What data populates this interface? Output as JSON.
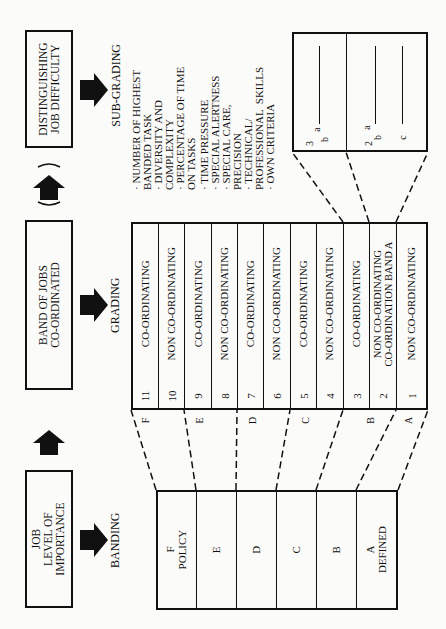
{
  "stages": {
    "job_level": {
      "label": "JOB\nLEVEL OF\nIMPORTANCE"
    },
    "band_of_jobs": {
      "label": "BAND OF JOBS\nCO-ORDINATED"
    },
    "job_difficulty": {
      "label": "DISTINGUISHING\nJOB DIFFICULTY"
    }
  },
  "process_labels": {
    "banding": "BANDING",
    "grading": "GRADING",
    "sub_grading": "SUB-GRADING"
  },
  "banding_table": {
    "bands": [
      {
        "label": "F\nPOLICY"
      },
      {
        "label": "E"
      },
      {
        "label": "D"
      },
      {
        "label": "C"
      },
      {
        "label": "B"
      },
      {
        "label": "A\nDEFINED"
      }
    ]
  },
  "grading_table": {
    "grades": [
      {
        "num": "11",
        "label": "CO-ORDINATING"
      },
      {
        "num": "10",
        "label": "NON CO-ORDINATING"
      },
      {
        "num": "9",
        "label": "CO-ORDINATING"
      },
      {
        "num": "8",
        "label": "NON CO-ORDINATING"
      },
      {
        "num": "7",
        "label": "CO-ORDINATING"
      },
      {
        "num": "6",
        "label": "NON CO-ORDINATING"
      },
      {
        "num": "5",
        "label": "CO-ORDINATING"
      },
      {
        "num": "4",
        "label": "NON CO-ORDINATING"
      },
      {
        "num": "3",
        "label": "CO-ORDINATING"
      },
      {
        "num": "2",
        "label": "NON CO-ORDINATING\nCO-ORDINATION BAND A"
      },
      {
        "num": "1",
        "label": "NON CO-ORDINATING"
      }
    ],
    "band_markers": [
      "F",
      "E",
      "D",
      "C",
      "B",
      "A"
    ]
  },
  "sub_grading": {
    "criteria": [
      "NUMBER OF HIGHEST\nBANDED TASK",
      "DIVERSITY AND\nCOMPLEXITY",
      "PERCENTAGE OF TIME\nON TASKS",
      "TIME PRESSURE",
      "SPECIAL ALERTNESS",
      "SPECIAL CARE,\nPRECISION",
      "TECHNICAL/\nPROFESSIONAL  SKILLS",
      "OWN CRITERIA"
    ],
    "grade_3": {
      "num": "3",
      "subs": [
        "a",
        "b"
      ]
    },
    "grade_2": {
      "num": "2",
      "subs": [
        "a",
        "b",
        "c"
      ]
    }
  },
  "colors": {
    "ink": "#111111",
    "paper": "#fbfbf9"
  }
}
